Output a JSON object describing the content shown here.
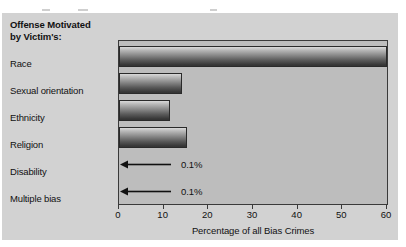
{
  "card": {
    "background_color": "#d2d2d2",
    "title_lines": [
      "Offense Motivated",
      "by Victim's:"
    ]
  },
  "chart_data": {
    "type": "bar",
    "orientation": "horizontal",
    "title": "Offense Motivated by Victim's:",
    "xlabel": "Percentage of all Bias Crimes",
    "ylabel": "",
    "xlim": [
      0,
      60
    ],
    "xticks": [
      0,
      10,
      20,
      30,
      40,
      50,
      60
    ],
    "xtick_labels": [
      "0",
      "10",
      "20",
      "30",
      "40",
      "50",
      "60"
    ],
    "grid": false,
    "legend": null,
    "categories": [
      "Race",
      "Sexual orientation",
      "Ethnicity",
      "Religion",
      "Disability",
      "Multiple bias"
    ],
    "values": [
      60.0,
      14.0,
      11.5,
      15.3,
      0.1,
      0.1
    ],
    "annotations": [
      {
        "category": "Disability",
        "text": "0.1%",
        "marker": "left-arrow"
      },
      {
        "category": "Multiple bias",
        "text": "0.1%",
        "marker": "left-arrow"
      }
    ],
    "bar_style": {
      "fill": "vertical-gradient-light-to-dark",
      "border_color": "#2a2a2a",
      "plot_background": "#bdbdbd"
    }
  }
}
